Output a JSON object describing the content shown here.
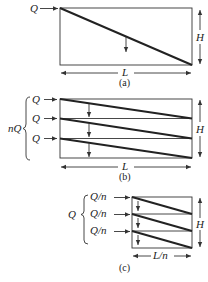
{
  "panels": {
    "a": {
      "caption": "(a)",
      "inflow_label": "Q",
      "height_label": "H",
      "length_label": "L"
    },
    "b": {
      "caption": "(b)",
      "total_label": "nQ",
      "inflow_labels": [
        "Q",
        "Q",
        "Q"
      ],
      "height_label": "H",
      "length_label": "L"
    },
    "c": {
      "caption": "(c)",
      "total_label": "Q",
      "inflow_labels": [
        "Q/n",
        "Q/n",
        "Q/n"
      ],
      "height_label": "H",
      "length_label": "L/n"
    }
  }
}
